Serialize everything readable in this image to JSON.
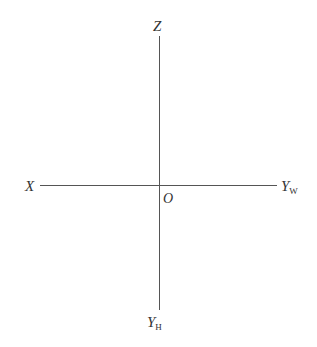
{
  "diagram": {
    "type": "projection-axes",
    "origin_label": "O",
    "axes": {
      "top": {
        "label": "Z",
        "subscript": ""
      },
      "left": {
        "label": "X",
        "subscript": ""
      },
      "right": {
        "label": "Y",
        "subscript": "W"
      },
      "bottom": {
        "label": "Y",
        "subscript": "H"
      }
    },
    "colors": {
      "line": "#555555",
      "text": "#333333",
      "background": "#ffffff"
    }
  }
}
